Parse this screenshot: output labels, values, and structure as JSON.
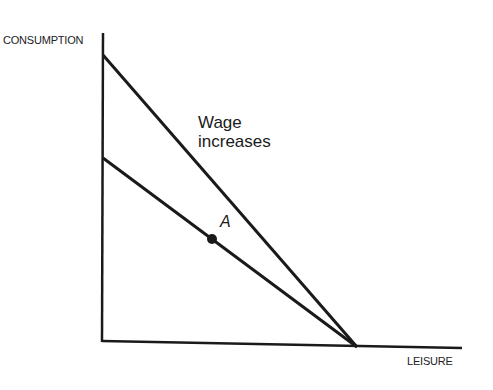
{
  "diagram": {
    "y_axis_label": "CONSUMPTION",
    "x_axis_label": "LEISURE",
    "annotation_line1": "Wage",
    "annotation_line2": "increases",
    "point_label": "A",
    "colors": {
      "line": "#1a1a1a",
      "background": "#ffffff"
    },
    "lines": [
      {
        "name": "original-budget-line",
        "from": [
          103,
          158
        ],
        "to": [
          357,
          347
        ]
      },
      {
        "name": "higher-wage-budget-line",
        "from": [
          103,
          55
        ],
        "to": [
          357,
          347
        ]
      }
    ],
    "point_A": [
      212,
      239
    ]
  }
}
